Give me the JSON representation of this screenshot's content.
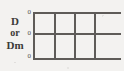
{
  "figure": {
    "background_color": "#f3f2f0",
    "line_color": "#5e5b58",
    "text_color": "#3b3a38"
  },
  "axis_label": {
    "line1": "D",
    "line2": "or",
    "line3": "Dm"
  },
  "chart_data": {
    "type": "line",
    "title": "",
    "subtitle": "",
    "xlabel": "",
    "ylabel": "D or Dm",
    "grid": true,
    "legend": null,
    "series": [],
    "x": [],
    "values": [],
    "y_tick_labels": [
      "0",
      "0",
      "0"
    ],
    "x_tick_labels": []
  },
  "ticks": {
    "top": "0",
    "middle": "0",
    "bottom": "0"
  },
  "grid": {
    "horizontal_lines": [
      {
        "name": "top-axis-line",
        "y": 0,
        "width": 88
      },
      {
        "name": "middle-axis-line",
        "y": 21,
        "width": 88
      },
      {
        "name": "bottom-axis-line",
        "y": 46,
        "width": 88
      }
    ],
    "vertical_lines": [
      {
        "name": "vline-1",
        "x": 0,
        "height": 48
      },
      {
        "name": "vline-2",
        "x": 21,
        "height": 48
      },
      {
        "name": "vline-3",
        "x": 41,
        "height": 48
      },
      {
        "name": "vline-4",
        "x": 61,
        "height": 48
      }
    ]
  }
}
